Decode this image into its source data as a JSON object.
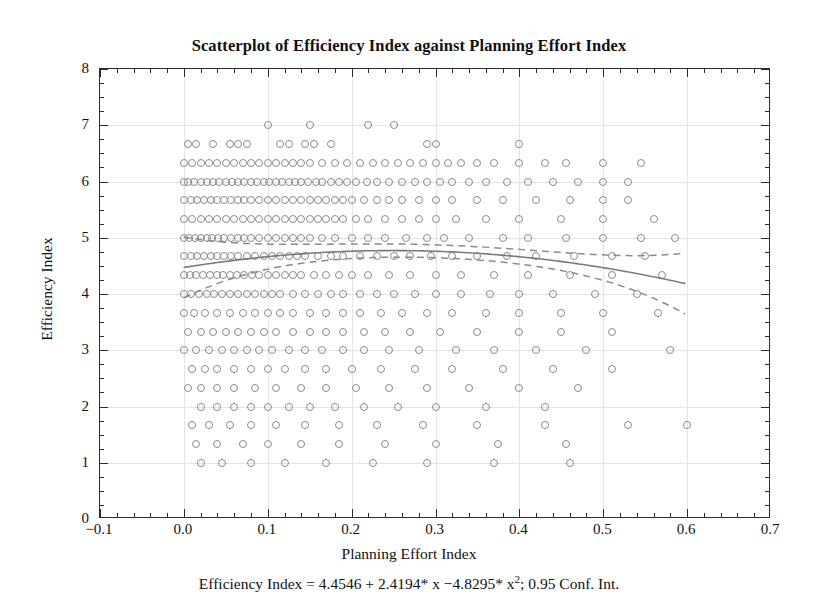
{
  "chart_data": {
    "type": "scatter",
    "title": "Scatterplot of Efficiency Index against Planning Effort Index",
    "caption_prefix": "Efficiency Index = 4.4546 + 2.4194",
    "caption_mid": "* x −4.8295* x",
    "caption_exp": "2",
    "caption_suffix": "; 0.95 Conf. Int.",
    "caption_full": "Efficiency Index = 4.4546 + 2.4194* x −4.8295* x2; 0.95 Conf. Int.",
    "xlabel": "Planning Effort Index",
    "ylabel": "Efficiency Index",
    "xlim": [
      -0.1,
      0.7
    ],
    "ylim": [
      0,
      8
    ],
    "xticks": [
      -0.1,
      0.0,
      0.1,
      0.2,
      0.3,
      0.4,
      0.5,
      0.6,
      0.7
    ],
    "xticklabels": [
      "−0.1",
      "0.0",
      "0.1",
      "0.2",
      "0.3",
      "0.4",
      "0.5",
      "0.6",
      "0.7"
    ],
    "yticks": [
      0,
      1,
      2,
      3,
      4,
      5,
      6,
      7,
      8
    ],
    "yticklabels": [
      "0",
      "1",
      "2",
      "3",
      "4",
      "5",
      "6",
      "7",
      "8"
    ],
    "grid": true,
    "legend": "none",
    "marker": "open-circle",
    "marker_color": "#8a8a8a",
    "line_color": "#7a7a7a",
    "fit": {
      "kind": "quadratic",
      "intercept": 4.4546,
      "linear_coef": 2.4194,
      "quadratic_coef": -4.8295,
      "x_start": 0.0,
      "x_end": 0.6,
      "confidence": 0.95,
      "band_style": "dashed"
    },
    "bands": [
      {
        "y": 7.0,
        "xs": [
          0.1,
          0.15,
          0.22,
          0.25
        ]
      },
      {
        "y": 6.67,
        "xs": [
          0.005,
          0.015,
          0.035,
          0.055,
          0.065,
          0.075,
          0.115,
          0.125,
          0.145,
          0.155,
          0.175,
          0.29,
          0.3,
          0.4
        ]
      },
      {
        "y": 6.33,
        "xs": [
          0.0,
          0.01,
          0.02,
          0.03,
          0.04,
          0.05,
          0.06,
          0.07,
          0.08,
          0.09,
          0.1,
          0.11,
          0.12,
          0.13,
          0.14,
          0.15,
          0.165,
          0.18,
          0.195,
          0.21,
          0.225,
          0.24,
          0.255,
          0.27,
          0.285,
          0.3,
          0.315,
          0.33,
          0.35,
          0.37,
          0.4,
          0.43,
          0.455,
          0.5,
          0.545
        ]
      },
      {
        "y": 6.0,
        "xs": [
          0.0,
          0.005,
          0.012,
          0.02,
          0.027,
          0.035,
          0.042,
          0.05,
          0.057,
          0.065,
          0.072,
          0.08,
          0.087,
          0.095,
          0.102,
          0.11,
          0.117,
          0.125,
          0.132,
          0.14,
          0.148,
          0.157,
          0.165,
          0.175,
          0.185,
          0.195,
          0.205,
          0.218,
          0.23,
          0.245,
          0.26,
          0.275,
          0.29,
          0.305,
          0.32,
          0.34,
          0.36,
          0.385,
          0.41,
          0.44,
          0.47,
          0.5,
          0.53
        ]
      },
      {
        "y": 5.67,
        "xs": [
          0.0,
          0.008,
          0.016,
          0.024,
          0.032,
          0.04,
          0.048,
          0.056,
          0.064,
          0.072,
          0.08,
          0.09,
          0.1,
          0.11,
          0.12,
          0.13,
          0.14,
          0.15,
          0.16,
          0.17,
          0.18,
          0.19,
          0.2,
          0.215,
          0.23,
          0.245,
          0.26,
          0.28,
          0.3,
          0.32,
          0.35,
          0.38,
          0.42,
          0.46,
          0.5,
          0.53
        ]
      },
      {
        "y": 5.33,
        "xs": [
          0.0,
          0.01,
          0.02,
          0.03,
          0.04,
          0.05,
          0.06,
          0.07,
          0.08,
          0.09,
          0.1,
          0.11,
          0.12,
          0.13,
          0.14,
          0.15,
          0.16,
          0.17,
          0.18,
          0.19,
          0.205,
          0.22,
          0.24,
          0.26,
          0.28,
          0.3,
          0.325,
          0.36,
          0.4,
          0.45,
          0.5,
          0.56
        ]
      },
      {
        "y": 5.0,
        "xs": [
          0.0,
          0.006,
          0.013,
          0.02,
          0.027,
          0.034,
          0.041,
          0.048,
          0.056,
          0.064,
          0.072,
          0.08,
          0.09,
          0.1,
          0.11,
          0.12,
          0.13,
          0.14,
          0.15,
          0.165,
          0.18,
          0.2,
          0.22,
          0.24,
          0.265,
          0.29,
          0.31,
          0.34,
          0.38,
          0.41,
          0.455,
          0.5,
          0.545,
          0.585
        ]
      },
      {
        "y": 4.67,
        "xs": [
          0.0,
          0.008,
          0.016,
          0.024,
          0.032,
          0.04,
          0.048,
          0.056,
          0.065,
          0.075,
          0.085,
          0.095,
          0.105,
          0.115,
          0.125,
          0.135,
          0.145,
          0.16,
          0.175,
          0.19,
          0.21,
          0.23,
          0.25,
          0.27,
          0.295,
          0.32,
          0.35,
          0.385,
          0.42,
          0.465,
          0.51,
          0.55
        ]
      },
      {
        "y": 4.33,
        "xs": [
          0.0,
          0.007,
          0.015,
          0.023,
          0.031,
          0.039,
          0.047,
          0.055,
          0.063,
          0.072,
          0.081,
          0.09,
          0.1,
          0.11,
          0.12,
          0.13,
          0.14,
          0.155,
          0.17,
          0.185,
          0.2,
          0.22,
          0.245,
          0.27,
          0.3,
          0.33,
          0.37,
          0.41,
          0.46,
          0.51,
          0.57
        ]
      },
      {
        "y": 4.0,
        "xs": [
          0.0,
          0.009,
          0.018,
          0.027,
          0.036,
          0.045,
          0.055,
          0.065,
          0.075,
          0.085,
          0.095,
          0.105,
          0.115,
          0.13,
          0.145,
          0.16,
          0.175,
          0.19,
          0.21,
          0.23,
          0.25,
          0.275,
          0.3,
          0.33,
          0.365,
          0.4,
          0.44,
          0.49,
          0.54
        ]
      },
      {
        "y": 3.67,
        "xs": [
          0.0,
          0.012,
          0.025,
          0.04,
          0.055,
          0.07,
          0.085,
          0.1,
          0.115,
          0.13,
          0.15,
          0.17,
          0.19,
          0.21,
          0.235,
          0.26,
          0.29,
          0.32,
          0.36,
          0.4,
          0.45,
          0.5,
          0.565
        ]
      },
      {
        "y": 3.33,
        "xs": [
          0.005,
          0.02,
          0.035,
          0.05,
          0.065,
          0.08,
          0.095,
          0.11,
          0.13,
          0.15,
          0.17,
          0.19,
          0.215,
          0.24,
          0.27,
          0.305,
          0.35,
          0.4,
          0.45,
          0.51
        ]
      },
      {
        "y": 3.0,
        "xs": [
          0.0,
          0.015,
          0.03,
          0.045,
          0.06,
          0.075,
          0.09,
          0.105,
          0.125,
          0.145,
          0.165,
          0.19,
          0.215,
          0.245,
          0.28,
          0.325,
          0.37,
          0.42,
          0.48,
          0.58
        ]
      },
      {
        "y": 2.67,
        "xs": [
          0.01,
          0.025,
          0.04,
          0.06,
          0.08,
          0.1,
          0.12,
          0.145,
          0.17,
          0.2,
          0.235,
          0.275,
          0.32,
          0.38,
          0.44,
          0.51
        ]
      },
      {
        "y": 2.33,
        "xs": [
          0.005,
          0.02,
          0.04,
          0.06,
          0.085,
          0.11,
          0.14,
          0.17,
          0.205,
          0.245,
          0.29,
          0.34,
          0.4,
          0.47
        ]
      },
      {
        "y": 2.0,
        "xs": [
          0.02,
          0.04,
          0.06,
          0.08,
          0.1,
          0.125,
          0.15,
          0.18,
          0.215,
          0.255,
          0.3,
          0.36,
          0.43
        ]
      },
      {
        "y": 1.67,
        "xs": [
          0.01,
          0.03,
          0.055,
          0.08,
          0.11,
          0.145,
          0.185,
          0.23,
          0.285,
          0.35,
          0.43,
          0.53,
          0.6
        ]
      },
      {
        "y": 1.33,
        "xs": [
          0.015,
          0.04,
          0.07,
          0.1,
          0.14,
          0.185,
          0.24,
          0.3,
          0.375,
          0.455
        ]
      },
      {
        "y": 1.0,
        "xs": [
          0.02,
          0.045,
          0.08,
          0.12,
          0.17,
          0.225,
          0.29,
          0.37,
          0.46
        ]
      }
    ]
  }
}
